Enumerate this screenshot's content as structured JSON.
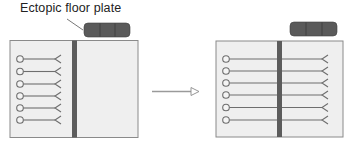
{
  "label": {
    "text": "Ectopic floor plate"
  },
  "colors": {
    "panel_fill": "#efefef",
    "panel_stroke": "#8a8a8a",
    "midline": "#5c5c5c",
    "axon": "#6e6e6e",
    "floor_plate": "#5a5a5a",
    "arrow": "#9a9a9a"
  },
  "panels": [
    {
      "name": "before",
      "axons_cross_midline": false,
      "axon_count": 6
    },
    {
      "name": "after",
      "axons_cross_midline": true,
      "axon_count": 6
    }
  ]
}
